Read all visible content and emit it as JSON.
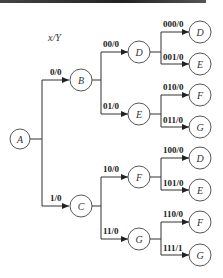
{
  "diagram": {
    "header_label": "x/Y",
    "root": "A",
    "level1": [
      {
        "edge": "0/0",
        "node": "B"
      },
      {
        "edge": "1/0",
        "node": "C"
      }
    ],
    "level2": [
      {
        "edge": "00/0",
        "node": "D"
      },
      {
        "edge": "01/0",
        "node": "E"
      },
      {
        "edge": "10/0",
        "node": "F"
      },
      {
        "edge": "11/0",
        "node": "G"
      }
    ],
    "level3": [
      {
        "edge": "000/0",
        "node": "D"
      },
      {
        "edge": "001/0",
        "node": "E"
      },
      {
        "edge": "010/0",
        "node": "F"
      },
      {
        "edge": "011/0",
        "node": "G"
      },
      {
        "edge": "100/0",
        "node": "D"
      },
      {
        "edge": "101/0",
        "node": "E"
      },
      {
        "edge": "110/0",
        "node": "F"
      },
      {
        "edge": "111/1",
        "node": "G"
      }
    ]
  }
}
